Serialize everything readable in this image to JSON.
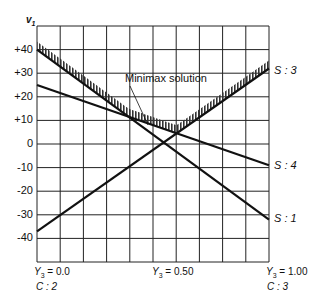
{
  "header_fragment": "25(1 − Y3)   40Y3   25   25Y3   60Y3   25   5Y3   7",
  "chart_data": {
    "type": "line",
    "title": "",
    "xlabel": "Y3",
    "ylabel": "v1",
    "xlim": [
      0,
      1
    ],
    "ylim": [
      -50,
      50
    ],
    "grid": true,
    "yticks": [
      "+40",
      "+30",
      "+20",
      "+10",
      "0",
      "-10",
      "-20",
      "-30",
      "-40"
    ],
    "x_ticks": [
      {
        "label": "Y3 = 0.0",
        "sub": "C : 2"
      },
      {
        "label": "Y3 = 0.50",
        "sub": ""
      },
      {
        "label": "Y3 = 1.00",
        "sub": "C : 3"
      }
    ],
    "series": [
      {
        "name": "S : 1",
        "x": [
          0,
          1
        ],
        "y": [
          40,
          -32
        ]
      },
      {
        "name": "S : 4",
        "x": [
          0,
          1
        ],
        "y": [
          25,
          -9
        ]
      },
      {
        "name": "S : 3",
        "x": [
          0,
          1
        ],
        "y": [
          -37,
          32
        ]
      }
    ],
    "annotations": [
      {
        "text": "Minimax solution",
        "x": 0.5,
        "y": 4
      }
    ]
  },
  "labels": {
    "ylabel": "v",
    "ylabel_sub": "1",
    "s1": "S : 1",
    "s3": "S : 3",
    "s4": "S : 4",
    "minimax": "Minimax solution",
    "x0": "Y",
    "x0_sub": "3",
    "x0_val": " = 0.0",
    "x0_c": "C : 2",
    "x50": "Y",
    "x50_sub": "3",
    "x50_val": " = 0.50",
    "x100": "Y",
    "x100_sub": "3",
    "x100_val": " = 1.00",
    "x100_c": "C : 3"
  }
}
